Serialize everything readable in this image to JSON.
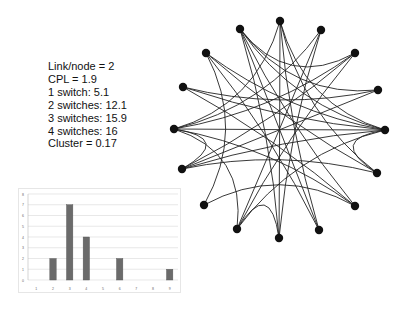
{
  "stats": {
    "lines": [
      "Link/node = 2",
      "CPL = 1.9",
      "1 switch: 5.1",
      "2 switches: 12.1",
      "3 switches: 15.9",
      "4 switches: 16",
      "Cluster = 0.17"
    ]
  },
  "colors": {
    "node": "#111111",
    "edge": "#222222",
    "bar": "#6b6b6b",
    "grid": "#d9d9d9"
  },
  "network": {
    "nodes": [
      {
        "id": 0,
        "x": 280,
        "y": 21
      },
      {
        "id": 1,
        "x": 321,
        "y": 30
      },
      {
        "id": 2,
        "x": 355,
        "y": 53
      },
      {
        "id": 3,
        "x": 378,
        "y": 90
      },
      {
        "id": 4,
        "x": 385,
        "y": 130
      },
      {
        "id": 5,
        "x": 377,
        "y": 173
      },
      {
        "id": 6,
        "x": 355,
        "y": 206
      },
      {
        "id": 7,
        "x": 319,
        "y": 230
      },
      {
        "id": 8,
        "x": 279,
        "y": 238
      },
      {
        "id": 9,
        "x": 237,
        "y": 229
      },
      {
        "id": 10,
        "x": 204,
        "y": 205
      },
      {
        "id": 11,
        "x": 182,
        "y": 169
      },
      {
        "id": 12,
        "x": 174,
        "y": 129
      },
      {
        "id": 13,
        "x": 183,
        "y": 87
      },
      {
        "id": 14,
        "x": 206,
        "y": 53
      },
      {
        "id": 15,
        "x": 240,
        "y": 29
      }
    ],
    "edges": [
      [
        0,
        12
      ],
      [
        0,
        7
      ],
      [
        0,
        5
      ],
      [
        0,
        8
      ],
      [
        1,
        12
      ],
      [
        1,
        9
      ],
      [
        1,
        8
      ],
      [
        2,
        11
      ],
      [
        2,
        9
      ],
      [
        2,
        15
      ],
      [
        3,
        15
      ],
      [
        3,
        13
      ],
      [
        4,
        12
      ],
      [
        4,
        13
      ],
      [
        4,
        14
      ],
      [
        4,
        15
      ],
      [
        4,
        11
      ],
      [
        4,
        9
      ],
      [
        4,
        5
      ],
      [
        4,
        0
      ],
      [
        5,
        14
      ],
      [
        5,
        11
      ],
      [
        6,
        15
      ],
      [
        6,
        13
      ],
      [
        6,
        10
      ],
      [
        7,
        15
      ],
      [
        7,
        14
      ],
      [
        8,
        9
      ],
      [
        8,
        15
      ],
      [
        9,
        12
      ],
      [
        10,
        14
      ],
      [
        11,
        12
      ],
      [
        11,
        3
      ],
      [
        12,
        2
      ],
      [
        12,
        6
      ]
    ]
  },
  "chart_data": {
    "type": "bar",
    "title": "",
    "xlabel": "",
    "ylabel": "",
    "categories": [
      "1",
      "2",
      "3",
      "4",
      "5",
      "6",
      "7",
      "8",
      "9"
    ],
    "values": [
      0,
      2,
      7,
      4,
      0,
      2,
      0,
      0,
      1
    ],
    "yticks": [
      0,
      1,
      2,
      3,
      4,
      5,
      6,
      7,
      8
    ],
    "ylim": [
      0,
      8
    ],
    "grid": true,
    "legend": "none"
  }
}
